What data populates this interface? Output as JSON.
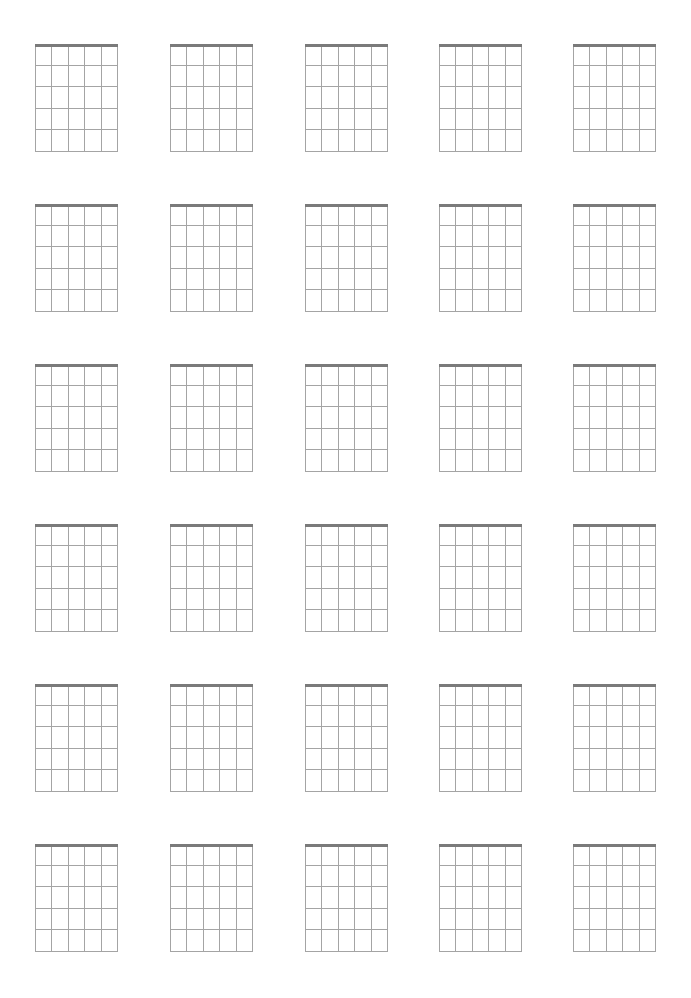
{
  "document": {
    "type": "blank chord diagram sheet",
    "rows": 6,
    "columns": 5,
    "diagram_count": 30,
    "colors": {
      "background": "#ffffff",
      "nut": "#7a7a7a",
      "grid_lines": "#a4a4a4"
    }
  },
  "layout": {
    "column_x": [
      35,
      170,
      305,
      439,
      573
    ],
    "row_y": [
      44,
      204,
      364,
      524,
      684,
      844
    ],
    "diagram_width": 82,
    "diagram_height": 108,
    "strings": 6,
    "frets": 5
  },
  "diagrams": [
    {
      "row": 1,
      "col": 1,
      "label": ""
    },
    {
      "row": 1,
      "col": 2,
      "label": ""
    },
    {
      "row": 1,
      "col": 3,
      "label": ""
    },
    {
      "row": 1,
      "col": 4,
      "label": ""
    },
    {
      "row": 1,
      "col": 5,
      "label": ""
    },
    {
      "row": 2,
      "col": 1,
      "label": ""
    },
    {
      "row": 2,
      "col": 2,
      "label": ""
    },
    {
      "row": 2,
      "col": 3,
      "label": ""
    },
    {
      "row": 2,
      "col": 4,
      "label": ""
    },
    {
      "row": 2,
      "col": 5,
      "label": ""
    },
    {
      "row": 3,
      "col": 1,
      "label": ""
    },
    {
      "row": 3,
      "col": 2,
      "label": ""
    },
    {
      "row": 3,
      "col": 3,
      "label": ""
    },
    {
      "row": 3,
      "col": 4,
      "label": ""
    },
    {
      "row": 3,
      "col": 5,
      "label": ""
    },
    {
      "row": 4,
      "col": 1,
      "label": ""
    },
    {
      "row": 4,
      "col": 2,
      "label": ""
    },
    {
      "row": 4,
      "col": 3,
      "label": ""
    },
    {
      "row": 4,
      "col": 4,
      "label": ""
    },
    {
      "row": 4,
      "col": 5,
      "label": ""
    },
    {
      "row": 5,
      "col": 1,
      "label": ""
    },
    {
      "row": 5,
      "col": 2,
      "label": ""
    },
    {
      "row": 5,
      "col": 3,
      "label": ""
    },
    {
      "row": 5,
      "col": 4,
      "label": ""
    },
    {
      "row": 5,
      "col": 5,
      "label": ""
    },
    {
      "row": 6,
      "col": 1,
      "label": ""
    },
    {
      "row": 6,
      "col": 2,
      "label": ""
    },
    {
      "row": 6,
      "col": 3,
      "label": ""
    },
    {
      "row": 6,
      "col": 4,
      "label": ""
    },
    {
      "row": 6,
      "col": 5,
      "label": ""
    }
  ]
}
